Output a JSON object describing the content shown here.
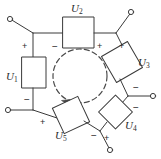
{
  "figure": {
    "type": "circuit-diagram",
    "width": 161,
    "height": 159,
    "background_color": "#ffffff",
    "line_color": "#3a3a3a",
    "text_color": "#2b2b2b"
  },
  "center_loop": {
    "name": "current-loop",
    "style": "dashed-circle",
    "direction": "clockwise",
    "cx": 80,
    "cy": 76,
    "r": 27
  },
  "elements": [
    {
      "id": "u1",
      "label": "U",
      "subscript": "1",
      "shape": "rectangle",
      "rotation_deg": 0,
      "plus": "+",
      "minus": "−",
      "plus_position": "top",
      "minus_position": "bottom"
    },
    {
      "id": "u2",
      "label": "U",
      "subscript": "2",
      "shape": "rectangle",
      "rotation_deg": 0,
      "plus": "+",
      "minus": "−",
      "plus_position": "right",
      "minus_position": "left"
    },
    {
      "id": "u3",
      "label": "U",
      "subscript": "3",
      "shape": "rectangle",
      "rotation_deg": -30,
      "plus": "+",
      "minus": "−",
      "plus_position": "top",
      "minus_position": "bottom"
    },
    {
      "id": "u4",
      "label": "U",
      "subscript": "4",
      "shape": "rectangle",
      "rotation_deg": 45,
      "plus": "+",
      "minus": "−",
      "plus_position": "bottom-left",
      "minus_position": "top-right"
    },
    {
      "id": "u5",
      "label": "U",
      "subscript": "5",
      "shape": "rectangle",
      "rotation_deg": -25,
      "plus": "+",
      "minus": "−",
      "plus_position": "left",
      "minus_position": "right"
    }
  ],
  "terminals": [
    {
      "id": "terminal-top-left",
      "x": 10,
      "y": 19
    },
    {
      "id": "terminal-top-right",
      "x": 131,
      "y": 12
    },
    {
      "id": "terminal-left",
      "x": 8,
      "y": 110
    },
    {
      "id": "terminal-right",
      "x": 153,
      "y": 96
    },
    {
      "id": "terminal-bottom",
      "x": 110,
      "y": 150
    }
  ],
  "extra_signs": [
    {
      "id": "sign-right-upper",
      "text": "−"
    }
  ],
  "labels": {
    "u1": "U",
    "u2": "U",
    "u3": "U",
    "u4": "U",
    "u5": "U",
    "u1_sub": "1",
    "u2_sub": "2",
    "u3_sub": "3",
    "u4_sub": "4",
    "u5_sub": "5"
  },
  "signs": {
    "u1_plus": "+",
    "u1_minus": "−",
    "u2_plus": "+",
    "u2_minus": "−",
    "u3_plus": "+",
    "u3_minus": "−",
    "u4_plus": "+",
    "u4_minus": "−",
    "u5_plus": "+",
    "u5_minus": "−",
    "right_extra_minus": "−"
  }
}
